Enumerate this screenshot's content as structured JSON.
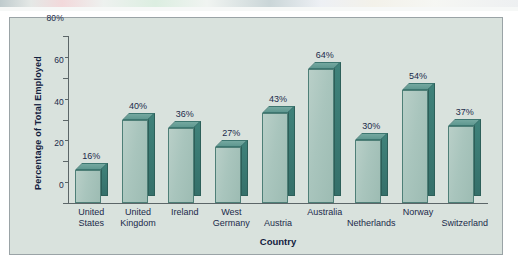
{
  "figure": {
    "panel_background": "#d9e2dd",
    "frame_border": "#9aa3a6",
    "axis_color": "#5c6668",
    "label_color": "#1b2a4a",
    "bar_front_color": "#a9c5bd",
    "bar_side_color": "#35706a",
    "bar_top_color": "#5f9890",
    "bar_outline_color": "#4e7f77"
  },
  "chart_data": {
    "type": "bar",
    "title": "",
    "subtitle": "",
    "xlabel": "Country",
    "ylabel": "Percentage of Total Employed",
    "categories": [
      "United States",
      "United Kingdom",
      "Ireland",
      "West Germany",
      "Austria",
      "Australia",
      "Netherlands",
      "Norway",
      "Switzerland"
    ],
    "category_lines": [
      [
        "United",
        "States"
      ],
      [
        "United",
        "Kingdom"
      ],
      [
        "Ireland",
        ""
      ],
      [
        "West",
        "Germany"
      ],
      [
        "Austria",
        ""
      ],
      [
        "Australia",
        ""
      ],
      [
        "Netherlands",
        ""
      ],
      [
        "Norway",
        ""
      ],
      [
        "Switzerland",
        ""
      ]
    ],
    "category_label_row": [
      0,
      0,
      0,
      0,
      1,
      0,
      1,
      0,
      1
    ],
    "values": [
      16,
      40,
      36,
      27,
      43,
      64,
      30,
      54,
      37
    ],
    "data_labels": [
      "16%",
      "40%",
      "36%",
      "27%",
      "43%",
      "64%",
      "30%",
      "54%",
      "37%"
    ],
    "ylim": [
      0,
      80
    ],
    "ytick_labels": [
      "80%",
      "60",
      "40",
      "20",
      "0"
    ],
    "ytick_values": [
      80,
      60,
      40,
      20,
      0
    ],
    "yminor_values": [
      70,
      50,
      30,
      10
    ],
    "grid": false,
    "legend": null,
    "legend_position": "none",
    "style": "3d-column"
  }
}
